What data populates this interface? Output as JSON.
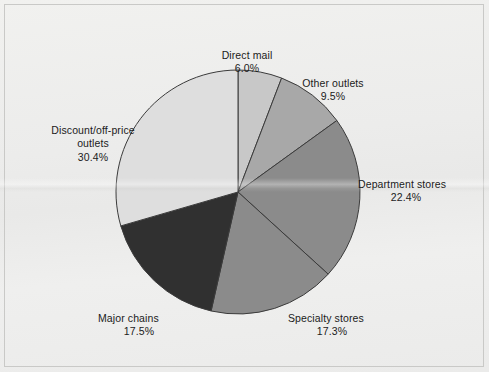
{
  "figure": {
    "background_color": "#ececea",
    "frame_color": "#c9c9c7",
    "label_color": "#1b1b1b",
    "slice_outline_color": "#3b3b3b"
  },
  "chart_data": {
    "type": "pie",
    "title": "",
    "subtitle": "",
    "xlabel": "",
    "ylabel": "",
    "legend_position": "none",
    "grid": false,
    "start_angle_deg": 90,
    "direction": "clockwise",
    "center": {
      "cx": 238,
      "cy": 192,
      "r": 122
    },
    "units": "percent",
    "total": 103.1,
    "categories": [
      "Direct mail",
      "Other outlets",
      "Department stores",
      "Specialty stores",
      "Major chains",
      "Discount/off-price outlets"
    ],
    "values": [
      6.0,
      9.5,
      22.4,
      17.3,
      17.5,
      30.4
    ],
    "value_labels": [
      "6.0%",
      "9.5%",
      "22.4%",
      "17.3%",
      "17.5%",
      "30.4%"
    ],
    "colors": [
      "#c8c8c8",
      "#a8a8a8",
      "#8b8b8b",
      "#8b8b8b",
      "#303030",
      "#dedede"
    ],
    "slices": [
      {
        "name": "direct-mail",
        "label": "Direct mail",
        "value": 6.0,
        "value_label": "6.0%",
        "color": "#c8c8c8",
        "label_text": "Direct mail"
      },
      {
        "name": "other-outlets",
        "label": "Other outlets",
        "value": 9.5,
        "value_label": "9.5%",
        "color": "#a8a8a8",
        "label_text": "Other outlets"
      },
      {
        "name": "department-stores",
        "label": "Department stores",
        "value": 22.4,
        "value_label": "22.4%",
        "color": "#8b8b8b",
        "label_text": "Department stores"
      },
      {
        "name": "specialty-stores",
        "label": "Specialty stores",
        "value": 17.3,
        "value_label": "17.3%",
        "color": "#8b8b8b",
        "label_text": "Specialty stores"
      },
      {
        "name": "major-chains",
        "label": "Major chains",
        "value": 17.5,
        "value_label": "17.5%",
        "color": "#303030",
        "label_text": "Major chains"
      },
      {
        "name": "discount-off-price-outlets",
        "label": "Discount/off-price outlets",
        "value": 30.4,
        "value_label": "30.4%",
        "color": "#dedede",
        "label_text": "Discount/off-price\noutlets"
      }
    ]
  }
}
